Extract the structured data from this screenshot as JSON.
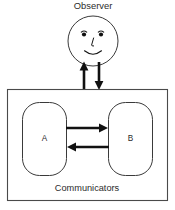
{
  "figure": {
    "title": "Observer",
    "caption": "Communicators",
    "nodes": [
      {
        "id": "A",
        "label": "A"
      },
      {
        "id": "B",
        "label": "B"
      }
    ],
    "face": {
      "nose_glyph": "L",
      "eye_left": "eye",
      "eye_right": "eye",
      "mouth": "smile"
    },
    "arrows": [
      {
        "name": "observer-up-arrow",
        "direction": "up",
        "from": "communicators-box",
        "to": "observer"
      },
      {
        "name": "observer-down-arrow",
        "direction": "down",
        "from": "observer",
        "to": "communicators-box"
      },
      {
        "name": "a-to-b-arrow",
        "direction": "right",
        "from": "A",
        "to": "B"
      },
      {
        "name": "b-to-a-arrow",
        "direction": "left",
        "from": "B",
        "to": "A"
      }
    ],
    "colors": {
      "background": "#ffffff",
      "outline": "#3a3a3a",
      "box_outline": "#4a4a4a",
      "arrow": "#111111",
      "text": "#2b2b2b"
    }
  }
}
